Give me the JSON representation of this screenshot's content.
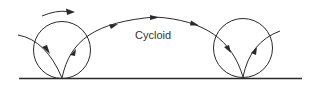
{
  "diagram": {
    "label": "Cycloid",
    "colors": {
      "line": "#2a2a2a",
      "text": "#333333",
      "background": "#ffffff"
    },
    "elements": {
      "ground_line": "horizontal baseline",
      "circles": [
        "left rolling circle",
        "right rolling circle"
      ],
      "rotation_arrow": "clockwise arrow above left circle",
      "arch": "cycloid arch between cusps with three direction arrows"
    }
  }
}
